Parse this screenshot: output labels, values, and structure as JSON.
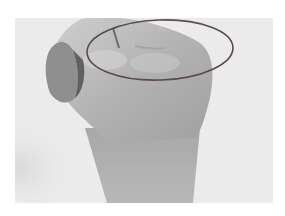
{
  "image": {
    "subject": "clenched fist with knuckles circled",
    "annotation": {
      "shape": "ellipse",
      "stroke_color": "#5a4a4a",
      "description": "ellipse outlining the knuckles"
    },
    "colors": {
      "background": "#ececec",
      "skin_light": "#cfcfcf",
      "skin_mid": "#b4b4b4",
      "skin_dark": "#8c8c8c",
      "shadow": "#4a4a4a"
    }
  }
}
